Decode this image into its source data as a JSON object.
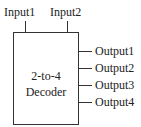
{
  "diagram": {
    "type": "block",
    "block": {
      "line1": "2-to-4",
      "line2": "Decoder"
    },
    "inputs": [
      {
        "label": "Input1"
      },
      {
        "label": "Input2"
      }
    ],
    "outputs": [
      {
        "label": "Output1"
      },
      {
        "label": "Output2"
      },
      {
        "label": "Output3"
      },
      {
        "label": "Output4"
      }
    ]
  }
}
